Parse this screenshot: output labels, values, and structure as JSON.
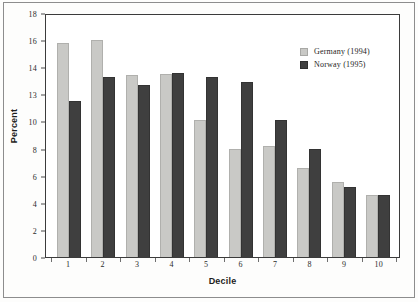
{
  "chart_data": {
    "type": "bar",
    "title": "",
    "xlabel": "Decile",
    "ylabel": "Percent",
    "categories": [
      "1",
      "2",
      "3",
      "4",
      "5",
      "6",
      "7",
      "8",
      "9",
      "10"
    ],
    "series": [
      {
        "name": "Germany (1994)",
        "color": "#c9c9c6",
        "values": [
          15.8,
          16.0,
          13.4,
          13.5,
          10.1,
          8.0,
          8.2,
          6.6,
          5.5,
          4.6
        ]
      },
      {
        "name": "Norway (1995)",
        "color": "#3f3f3f",
        "values": [
          11.5,
          13.3,
          12.7,
          13.6,
          13.3,
          12.9,
          10.1,
          8.0,
          5.2,
          4.6
        ]
      }
    ],
    "ylim": [
      0,
      18
    ],
    "ytick_labels": [
      "18",
      "16",
      "14",
      "13",
      "10",
      "8",
      "6",
      "4",
      "2",
      "0"
    ],
    "ytick_values": [
      18,
      16,
      14,
      12,
      10,
      8,
      6,
      4,
      2,
      0
    ],
    "grid": false,
    "legend_position": "top-right"
  },
  "legend": {
    "items": [
      {
        "label": "Germany (1994)"
      },
      {
        "label": "Norway (1995)"
      }
    ]
  }
}
